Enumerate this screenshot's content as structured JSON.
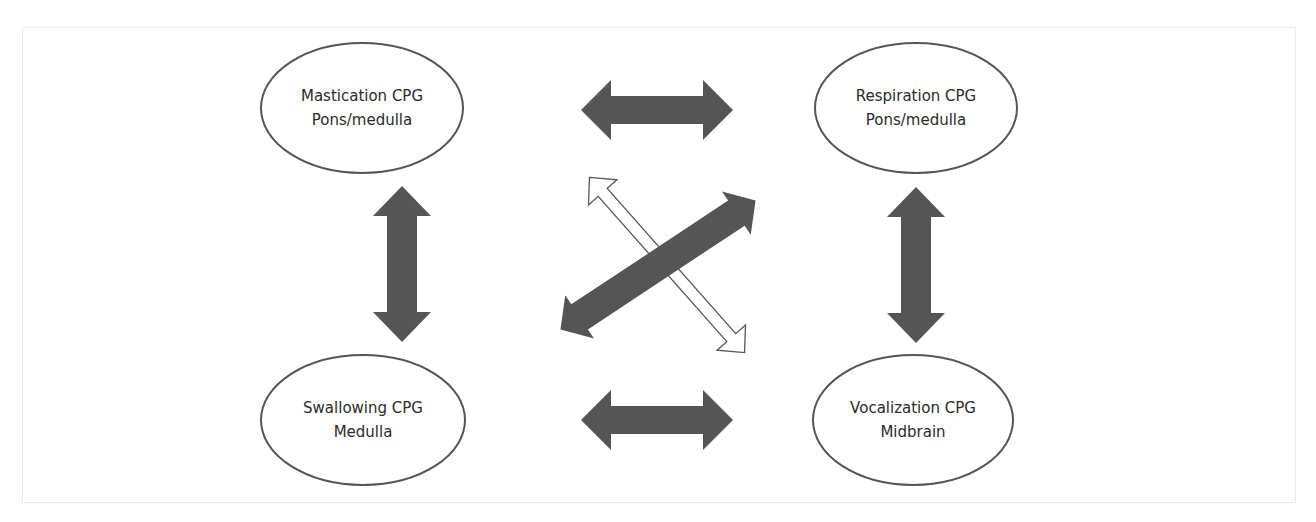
{
  "diagram": {
    "type": "cpg-interaction-diagram",
    "colors": {
      "background": "#ffffff",
      "frame_border": "#ececec",
      "ellipse_stroke": "#555555",
      "arrow_fill_dark": "#555555",
      "arrow_outline": "#555555",
      "text": "#2b2b2b"
    },
    "nodes": [
      {
        "id": "mastication",
        "title": "Mastication CPG",
        "location": "Pons/medulla"
      },
      {
        "id": "respiration",
        "title": "Respiration CPG",
        "location": "Pons/medulla"
      },
      {
        "id": "swallowing",
        "title": "Swallowing CPG",
        "location": "Medulla"
      },
      {
        "id": "vocalization",
        "title": "Vocalization CPG",
        "location": "Midbrain"
      }
    ],
    "edges": [
      {
        "from": "mastication",
        "to": "respiration",
        "style": "bidirectional-solid-dark"
      },
      {
        "from": "swallowing",
        "to": "vocalization",
        "style": "bidirectional-solid-dark"
      },
      {
        "from": "mastication",
        "to": "swallowing",
        "style": "bidirectional-solid-dark"
      },
      {
        "from": "respiration",
        "to": "vocalization",
        "style": "bidirectional-solid-dark"
      },
      {
        "from": "swallowing",
        "to": "respiration",
        "style": "bidirectional-solid-dark"
      },
      {
        "from": "mastication",
        "to": "vocalization",
        "style": "bidirectional-outline-white"
      }
    ]
  }
}
